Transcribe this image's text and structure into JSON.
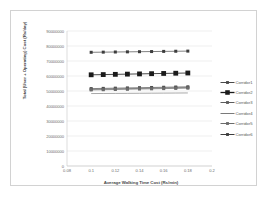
{
  "chart_data": {
    "type": "line",
    "title": "",
    "xlabel": "Average Walking Time Cost (Rs/min)",
    "ylabel": "Total (User + Operating) Cost (Rs/day)",
    "xlim": [
      0.08,
      0.2
    ],
    "ylim": [
      0,
      90000000
    ],
    "grid": true,
    "legend_position": "right",
    "x": [
      0.1,
      0.11,
      0.12,
      0.13,
      0.14,
      0.15,
      0.16,
      0.17,
      0.18
    ],
    "x_ticks": [
      "0.08",
      "0.1",
      "0.12",
      "0.14",
      "0.16",
      "0.18",
      "0.2"
    ],
    "x_tick_values": [
      0.08,
      0.1,
      0.12,
      0.14,
      0.16,
      0.18,
      0.2
    ],
    "y_ticks": [
      "0",
      "10000000",
      "20000000",
      "30000000",
      "40000000",
      "50000000",
      "60000000",
      "70000000",
      "80000000",
      "90000000"
    ],
    "y_tick_values": [
      0,
      10000000,
      20000000,
      30000000,
      40000000,
      50000000,
      60000000,
      70000000,
      80000000,
      90000000
    ],
    "series": [
      {
        "name": "Corridor1",
        "marker": "small-square",
        "color": "#4a4a4a",
        "values": [
          51600000,
          51750000,
          51900000,
          52050000,
          52200000,
          52350000,
          52500000,
          52650000,
          52800000
        ]
      },
      {
        "name": "Corridor2",
        "marker": "large-square",
        "color": "#1a1a1a",
        "values": [
          60800000,
          60950000,
          61100000,
          61250000,
          61400000,
          61550000,
          61700000,
          61850000,
          62000000
        ]
      },
      {
        "name": "Corridor3",
        "marker": "small-square",
        "color": "#5c5c5c",
        "values": [
          51100000,
          51250000,
          51400000,
          51550000,
          51700000,
          51850000,
          52000000,
          52150000,
          52300000
        ]
      },
      {
        "name": "Corridor4",
        "marker": "none",
        "color": "#7a7a7a",
        "values": [
          48300000,
          48350000,
          48400000,
          48450000,
          48500000,
          48550000,
          48600000,
          48650000,
          48700000
        ]
      },
      {
        "name": "Corridor5",
        "marker": "small-square",
        "color": "#6b6b6b",
        "values": [
          50700000,
          50850000,
          51000000,
          51150000,
          51300000,
          51450000,
          51600000,
          51750000,
          51900000
        ]
      },
      {
        "name": "Corridor6",
        "marker": "small-square",
        "color": "#3d3d3d",
        "values": [
          75800000,
          75900000,
          76000000,
          76100000,
          76200000,
          76300000,
          76400000,
          76500000,
          76600000
        ]
      }
    ]
  },
  "legend": {
    "items": [
      {
        "label": "Corridor1"
      },
      {
        "label": "Corridor2"
      },
      {
        "label": "Corridor3"
      },
      {
        "label": "Corridor4"
      },
      {
        "label": "Corridor5"
      },
      {
        "label": "Corridor6"
      }
    ]
  },
  "colors": {
    "frame": "#d2d2d2",
    "gridline": "#dedede",
    "axis_line": "#c8c8c8",
    "tick_text": "#6d6d6d",
    "title_text": "#4a4a4a"
  }
}
